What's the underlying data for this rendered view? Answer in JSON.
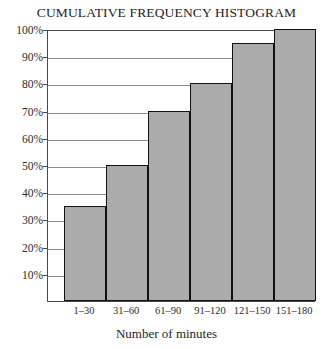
{
  "chart_data": {
    "type": "bar",
    "title": "CUMULATIVE FREQUENCY HISTOGRAM",
    "xlabel": "Number of minutes",
    "ylabel": "",
    "categories": [
      "1–30",
      "31–60",
      "61–90",
      "91–120",
      "121–150",
      "151–180"
    ],
    "values": [
      35,
      50,
      70,
      80,
      95,
      100
    ],
    "value_suffix": "%",
    "ylim": [
      0,
      100
    ],
    "ytick_values": [
      10,
      20,
      30,
      40,
      50,
      60,
      70,
      80,
      90,
      100
    ],
    "ytick_labels": [
      "10%",
      "20%",
      "30%",
      "40%",
      "50%",
      "60%",
      "70%",
      "80%",
      "90%",
      "100%"
    ],
    "grid": true,
    "grid_axis": "y",
    "legend": false,
    "bar_fill_color": "#ababab",
    "bar_border_color": "#111111",
    "gridline_color": "#8d8d8d",
    "frame_color": "#4a4a4a",
    "background_color": "#ffffff",
    "bar_gap_left_fraction": 0.06,
    "bars_touch": true
  }
}
